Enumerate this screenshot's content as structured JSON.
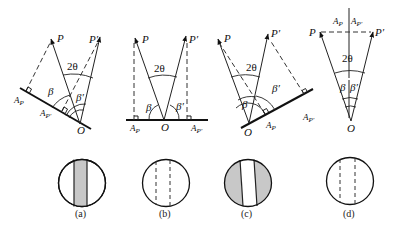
{
  "figure": {
    "panels": [
      {
        "id": "a",
        "caption": "(a)",
        "labels": {
          "P": "P",
          "P_prime": "P′",
          "two_theta": "2θ",
          "beta": "β",
          "beta_prime": "β′",
          "O": "O",
          "A_P": "A",
          "A_P_sub": "P",
          "A_Pp": "A",
          "A_Pp_sub": "P′"
        },
        "viewer": "shaded-center-band"
      },
      {
        "id": "b",
        "caption": "(b)",
        "labels": {
          "P": "P",
          "P_prime": "P′",
          "two_theta": "2θ",
          "beta": "β",
          "beta_prime": "β′",
          "O": "O",
          "A_P": "A",
          "A_P_sub": "P",
          "A_Pp": "A",
          "A_Pp_sub": "P′"
        },
        "viewer": "dashed-lines-only"
      },
      {
        "id": "c",
        "caption": "(c)",
        "labels": {
          "P": "P",
          "P_prime": "P′",
          "two_theta": "2θ",
          "beta": "β",
          "beta_prime": "β′",
          "O": "O",
          "A_P": "A",
          "A_P_sub": "P",
          "A_Pp": "A",
          "A_Pp_sub": "P′"
        },
        "viewer": "shaded-sides"
      },
      {
        "id": "d",
        "caption": "(d)",
        "labels": {
          "P": "P",
          "P_prime": "P′",
          "two_theta": "2θ",
          "beta": "β",
          "beta_prime": "β′",
          "O": "O",
          "A_P": "A",
          "A_P_sub": "P",
          "A_Pp": "A",
          "A_Pp_sub": "P′"
        },
        "viewer": "dashed-lines-only"
      }
    ],
    "colors": {
      "line": "#222222",
      "shade": "#c8c8c8",
      "background": "#ffffff"
    }
  }
}
